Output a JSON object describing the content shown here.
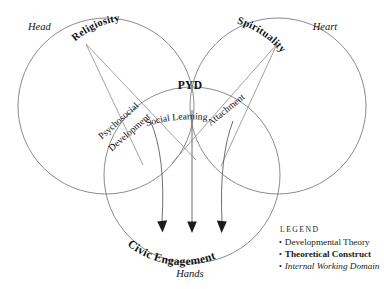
{
  "figure": {
    "type": "venn-diagram",
    "background": "#ffffff",
    "stroke_color": "#7d7d82",
    "text_color": "#111111"
  },
  "domains": [
    {
      "id": "head",
      "label": "Head",
      "style": "internal-working-domain"
    },
    {
      "id": "heart",
      "label": "Heart",
      "style": "internal-working-domain"
    },
    {
      "id": "hands",
      "label": "Hands",
      "style": "internal-working-domain"
    }
  ],
  "constructs": [
    {
      "id": "religiosity",
      "label": "Religiosity",
      "style": "theoretical-construct"
    },
    {
      "id": "spirituality",
      "label": "Spirituality",
      "style": "theoretical-construct"
    },
    {
      "id": "pyd",
      "label": "PYD",
      "style": "theoretical-construct"
    },
    {
      "id": "civic-engagement",
      "label": "Civic Engagement",
      "style": "theoretical-construct"
    }
  ],
  "theories": [
    {
      "id": "psychosocial-development",
      "label_line1": "Psychosocial",
      "label_line2": "Development",
      "style": "developmental-theory"
    },
    {
      "id": "attachment",
      "label": "Attachment",
      "style": "developmental-theory"
    },
    {
      "id": "social-learning",
      "label": "Social Learning",
      "style": "developmental-theory"
    }
  ],
  "legend": {
    "title": "Legend",
    "bullet": "•",
    "items": [
      {
        "id": "developmental-theory",
        "label": "Developmental Theory"
      },
      {
        "id": "theoretical-construct",
        "label": "Theoretical Construct"
      },
      {
        "id": "internal-working-domain",
        "label": "Internal Working Domain"
      }
    ]
  }
}
